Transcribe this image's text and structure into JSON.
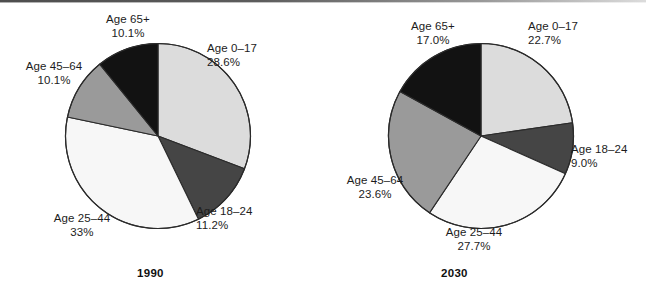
{
  "figure": {
    "background_color": "#ffffff",
    "label_text_color": "#1c1c1c"
  },
  "palette": {
    "age_0_17": "#dcdcdc",
    "age_18_24": "#454545",
    "age_25_44": "#f7f7f7",
    "age_45_64": "#9a9a9a",
    "age_65_plus": "#121212",
    "outline": "#2b2b2b"
  },
  "panels": [
    {
      "id": "panel-1990",
      "year_label": "1990",
      "labels": [
        {
          "name": "Age 0–17",
          "value": "28.6%"
        },
        {
          "name": "Age 18–24",
          "value": "11.2%"
        },
        {
          "name": "Age 25–44",
          "value": "33%"
        },
        {
          "name": "Age 45–64",
          "value": "10.1%"
        },
        {
          "name": "Age 65+",
          "value": "10.1%"
        }
      ]
    },
    {
      "id": "panel-2030",
      "year_label": "2030",
      "labels": [
        {
          "name": "Age 0–17",
          "value": "22.7%"
        },
        {
          "name": "Age 18–24",
          "value": "9.0%"
        },
        {
          "name": "Age 25–44",
          "value": "27.7%"
        },
        {
          "name": "Age 45–64",
          "value": "23.6%"
        },
        {
          "name": "Age 65+",
          "value": "17.0%"
        }
      ]
    }
  ],
  "chart_data": [
    {
      "type": "pie",
      "title": "1990",
      "categories": [
        "Age 0–17",
        "Age 18–24",
        "Age 25–44",
        "Age 45–64",
        "Age 65+"
      ],
      "values": [
        28.6,
        11.2,
        33.0,
        10.1,
        10.1
      ],
      "value_labels": [
        "28.6%",
        "11.2%",
        "33%",
        "10.1%",
        "10.1%"
      ],
      "unit": "percent",
      "colors": [
        "#dcdcdc",
        "#454545",
        "#f7f7f7",
        "#9a9a9a",
        "#121212"
      ],
      "start_angle_deg": 0,
      "direction": "clockwise",
      "legend": "none",
      "labels_position": "outside-callout",
      "xlabel": "",
      "ylabel": ""
    },
    {
      "type": "pie",
      "title": "2030",
      "categories": [
        "Age 0–17",
        "Age 18–24",
        "Age 25–44",
        "Age 45–64",
        "Age 65+"
      ],
      "values": [
        22.7,
        9.0,
        27.7,
        23.6,
        17.0
      ],
      "value_labels": [
        "22.7%",
        "9.0%",
        "27.7%",
        "23.6%",
        "17.0%"
      ],
      "unit": "percent",
      "colors": [
        "#dcdcdc",
        "#454545",
        "#f7f7f7",
        "#9a9a9a",
        "#121212"
      ],
      "start_angle_deg": 0,
      "direction": "clockwise",
      "legend": "none",
      "labels_position": "outside-callout",
      "xlabel": "",
      "ylabel": ""
    }
  ]
}
